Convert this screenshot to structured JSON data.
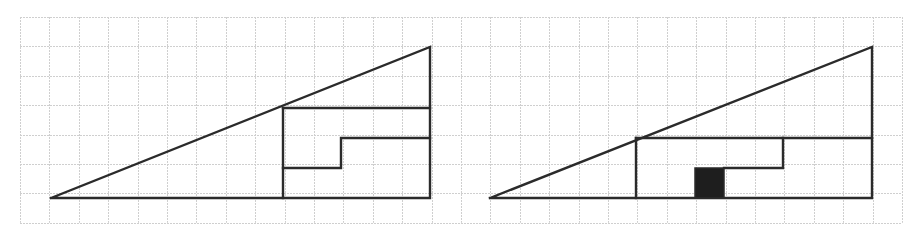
{
  "diagram": {
    "colors": {
      "grid": "#cfcfcf",
      "stroke": "#2b2b2b",
      "hole": "#1e1e1e",
      "background": "#ffffff"
    },
    "grid": {
      "cell": 29.4,
      "origin_x": 20,
      "origin_y": 17,
      "cols": 30,
      "rows": 7,
      "width_px": 882
    },
    "panels": [
      {
        "name": "left-arrangement",
        "offset_x": 20,
        "triangle_base_cols": 13,
        "triangle_height_rows": 5,
        "pieces": [
          {
            "name": "large-triangle",
            "points_grid": [
              [
                1,
                6
              ],
              [
                8,
                4
              ],
              [
                8,
                6
              ]
            ]
          },
          {
            "name": "small-triangle",
            "points_grid": [
              [
                8,
                4
              ],
              [
                13,
                1
              ],
              [
                13,
                4
              ]
            ]
          },
          {
            "name": "upper-l-piece",
            "points_grid": [
              [
                8,
                4
              ],
              [
                13,
                4
              ],
              [
                13,
                5
              ],
              [
                10,
                5
              ],
              [
                10,
                6
              ],
              [
                8,
                6
              ]
            ]
          },
          {
            "name": "lower-l-piece",
            "points_grid": [
              [
                8,
                6
              ],
              [
                10,
                6
              ],
              [
                10,
                5
              ],
              [
                13,
                5
              ],
              [
                13,
                7
              ],
              [
                8,
                7
              ]
            ]
          }
        ],
        "hole": null
      },
      {
        "name": "right-arrangement",
        "offset_x": 460,
        "triangle_base_cols": 13,
        "triangle_height_rows": 5,
        "pieces": [
          {
            "name": "small-triangle",
            "points_grid": [
              [
                1,
                7
              ],
              [
                6,
                5
              ],
              [
                6,
                7
              ]
            ]
          },
          {
            "name": "large-triangle",
            "points_grid": [
              [
                6,
                5
              ],
              [
                13,
                2
              ],
              [
                13,
                5
              ]
            ]
          },
          {
            "name": "upper-l-piece",
            "points_grid": [
              [
                6,
                5
              ],
              [
                11,
                5
              ],
              [
                11,
                6
              ],
              [
                8,
                6
              ],
              [
                8,
                7
              ],
              [
                6,
                7
              ]
            ]
          },
          {
            "name": "lower-l-piece",
            "points_grid": [
              [
                9,
                6
              ],
              [
                11,
                6
              ],
              [
                11,
                5
              ],
              [
                13,
                5
              ],
              [
                13,
                7
              ],
              [
                9,
                7
              ]
            ]
          }
        ],
        "hole": {
          "col": 8,
          "row": 6,
          "size": 1
        }
      }
    ]
  }
}
